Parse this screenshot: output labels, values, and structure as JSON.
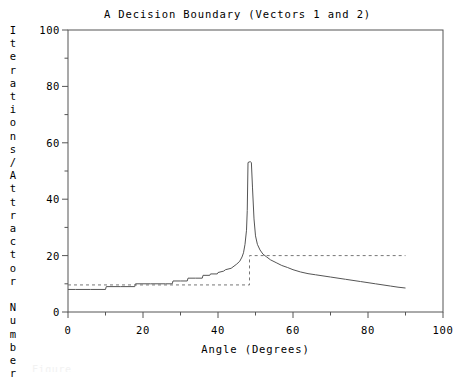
{
  "chart_data": {
    "type": "line",
    "title": "A Decision Boundary (Vectors 1 and 2)",
    "xlabel": "Angle (Degrees)",
    "ylabel": "Iterations/Attractor Number",
    "ylabel_chars": [
      "I",
      "t",
      "e",
      "r",
      "a",
      "t",
      "i",
      "o",
      "n",
      "s",
      "/",
      "A",
      "t",
      "t",
      "r",
      "a",
      "c",
      "t",
      "o",
      "r",
      "",
      "N",
      "u",
      "m",
      "b",
      "e",
      "r"
    ],
    "xlim": [
      0,
      100
    ],
    "ylim": [
      0,
      100
    ],
    "xticks": [
      0,
      20,
      40,
      60,
      80,
      100
    ],
    "yticks": [
      0,
      20,
      40,
      60,
      80,
      100
    ],
    "xminorticks": [
      10,
      30,
      50,
      70,
      90
    ],
    "yminorticks": [
      10,
      30,
      50,
      70,
      90
    ],
    "grid": false,
    "legend": "none",
    "frame": "box",
    "series": [
      {
        "name": "Iterations",
        "style": "solid",
        "color": "#555555",
        "x": [
          0,
          2,
          4,
          6,
          8,
          10,
          10.2,
          12,
          14,
          16,
          17.8,
          18,
          20,
          22,
          24,
          26,
          27.8,
          28,
          30,
          31.8,
          32,
          34,
          35.8,
          36,
          37.8,
          38,
          39.8,
          40,
          41.5,
          42,
          43.5,
          44,
          45,
          45.8,
          46.4,
          46.8,
          47.2,
          47.6,
          47.8,
          48.0,
          48.3,
          48.6,
          48.9,
          49.2,
          49.6,
          50.0,
          50.5,
          51.2,
          52,
          53,
          54,
          55.5,
          57,
          58.5,
          60,
          62,
          64,
          66,
          68,
          70,
          72,
          74,
          76,
          78,
          80,
          82,
          84,
          86,
          88,
          90
        ],
        "y": [
          8.0,
          8.0,
          8.0,
          8.0,
          8.0,
          8.0,
          9.0,
          9.0,
          9.0,
          9.0,
          9.0,
          10.0,
          10.0,
          10.0,
          10.0,
          10.0,
          10.0,
          11.0,
          11.0,
          11.0,
          12.0,
          12.0,
          12.0,
          13.0,
          13.0,
          13.5,
          13.5,
          14.0,
          14.5,
          15.0,
          15.5,
          16.0,
          17.0,
          18.0,
          19.5,
          21.0,
          24.0,
          29.0,
          36.0,
          53.0,
          53.2,
          53.3,
          53.0,
          44.0,
          33.0,
          27.0,
          24.0,
          22.0,
          20.5,
          19.5,
          18.5,
          17.5,
          16.5,
          15.8,
          15.0,
          14.2,
          13.6,
          13.2,
          12.8,
          12.4,
          12.0,
          11.6,
          11.2,
          10.8,
          10.4,
          10.0,
          9.6,
          9.2,
          8.8,
          8.5
        ]
      },
      {
        "name": "Attractor Number",
        "style": "dashed",
        "color": "#777777",
        "x": [
          0,
          48.4,
          48.4,
          90
        ],
        "y": [
          9.6,
          9.6,
          20.0,
          20.0
        ]
      }
    ],
    "annotations": {
      "peak_value": 53,
      "peak_angle": 48,
      "step_angle": 48.4,
      "step_low": 9.6,
      "step_high": 20
    }
  },
  "caption": {
    "cut_off_text": "Figure"
  }
}
